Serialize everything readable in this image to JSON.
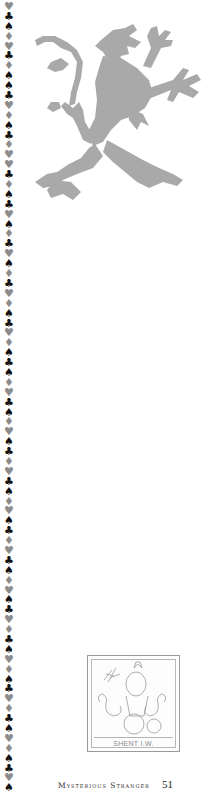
{
  "page": {
    "running_title": "Mysterious Stranger",
    "page_number": "51"
  },
  "border": {
    "description": "vertical column of card suit symbols",
    "colors": {
      "black": "#111111",
      "gray": "#8c8c8c"
    },
    "sequence": [
      "heart",
      "club",
      "spade",
      "diamond",
      "heart",
      "club",
      "diamond",
      "spade",
      "spade",
      "club",
      "heart",
      "diamond",
      "spade",
      "club",
      "diamond",
      "heart",
      "heart",
      "club",
      "diamond",
      "spade",
      "club",
      "heart",
      "spade",
      "diamond",
      "club",
      "heart",
      "spade",
      "diamond",
      "club",
      "heart",
      "diamond",
      "spade",
      "club",
      "heart",
      "diamond",
      "spade",
      "club",
      "spade",
      "diamond",
      "heart",
      "club",
      "spade",
      "diamond",
      "heart",
      "spade",
      "club",
      "diamond",
      "heart",
      "club",
      "spade",
      "diamond",
      "heart",
      "spade",
      "club",
      "diamond",
      "heart",
      "club",
      "spade",
      "diamond",
      "heart",
      "spade",
      "club",
      "heart",
      "diamond",
      "club",
      "spade",
      "heart",
      "diamond",
      "spade",
      "club",
      "heart",
      "diamond",
      "club",
      "spade",
      "heart",
      "diamond",
      "spade",
      "club",
      "heart",
      "spade"
    ]
  },
  "illustrations": {
    "lion": {
      "label": "heraldic lion rampant",
      "color": "#a9a9a9"
    },
    "bookplate": {
      "caption": "SHENT I.W.",
      "label": "engraved bookplate with swans and figure"
    }
  }
}
